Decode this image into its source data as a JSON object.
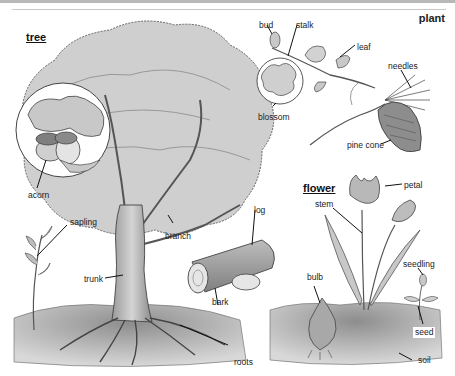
{
  "page": {
    "section_title": "plant",
    "colors": {
      "ink": "#222222",
      "foliage": "#bfbfbf",
      "soil": "#9a9a9a",
      "background": "#ffffff"
    }
  },
  "groups": {
    "tree": {
      "heading": "tree",
      "labels": {
        "acorn": "acorn",
        "sapling": "sapling",
        "branch": "branch",
        "trunk": "trunk",
        "roots": "roots",
        "log": "log",
        "bark": "bark"
      }
    },
    "plant": {
      "labels": {
        "bud": "bud",
        "stalk": "stalk",
        "leaf": "leaf",
        "blossom": "blossom",
        "needles": "needles",
        "pine_cone": "pine cone"
      }
    },
    "flower": {
      "heading": "flower",
      "labels": {
        "petal": "petal",
        "stem": "stem",
        "bulb": "bulb",
        "seedling": "seedling",
        "seed": "seed",
        "soil": "soil"
      }
    }
  }
}
